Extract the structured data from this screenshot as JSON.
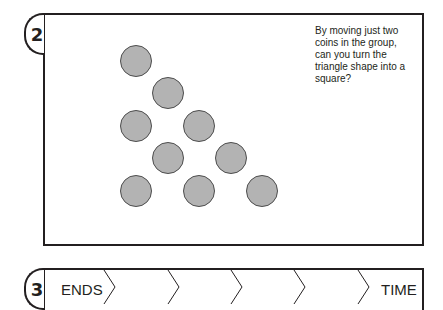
{
  "puzzle2": {
    "number": "2",
    "question": "By moving just two coins in the group, can you turn the triangle shape into a square?",
    "coins": [
      {
        "x": 136,
        "y": 61
      },
      {
        "x": 168,
        "y": 93
      },
      {
        "x": 136,
        "y": 126
      },
      {
        "x": 199,
        "y": 126
      },
      {
        "x": 168,
        "y": 158
      },
      {
        "x": 231,
        "y": 158
      },
      {
        "x": 136,
        "y": 191
      },
      {
        "x": 199,
        "y": 191
      },
      {
        "x": 262,
        "y": 191
      }
    ],
    "coin_color": "#b3b3b3"
  },
  "puzzle3": {
    "number": "3",
    "start_label": "ENDS",
    "end_label": "TIME",
    "blank_cells": 5
  }
}
